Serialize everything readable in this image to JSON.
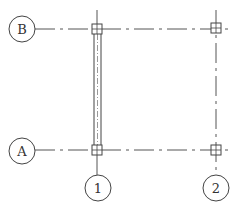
{
  "diagram": {
    "type": "structural-grid-plan",
    "colors": {
      "line": "#444444",
      "wall_inner": "#999999",
      "background": "#ffffff"
    },
    "grid_lines": {
      "horizontal": [
        {
          "label": "B",
          "y": 29,
          "bubble": {
            "cx": 22,
            "cy": 29,
            "r": 13
          },
          "x_start": 35,
          "x_end": 228
        },
        {
          "label": "A",
          "y": 150,
          "bubble": {
            "cx": 22,
            "cy": 151,
            "r": 13
          },
          "x_start": 35,
          "x_end": 228
        }
      ],
      "vertical": [
        {
          "label": "1",
          "x": 97,
          "bubble": {
            "cx": 98,
            "cy": 188,
            "r": 13
          },
          "y_start": 10,
          "y_end": 175
        },
        {
          "label": "2",
          "x": 216,
          "bubble": {
            "cx": 216,
            "cy": 188,
            "r": 13
          },
          "y_start": 10,
          "y_end": 175
        }
      ]
    },
    "columns": [
      {
        "grid": "B-1",
        "cx": 97,
        "cy": 29,
        "size": 10
      },
      {
        "grid": "B-2",
        "cx": 216,
        "cy": 28,
        "size": 10
      },
      {
        "grid": "A-1",
        "cx": 97,
        "cy": 150,
        "size": 10
      },
      {
        "grid": "A-2",
        "cx": 216,
        "cy": 150,
        "size": 10
      }
    ],
    "walls": [
      {
        "along": "grid 1",
        "from": "B",
        "to": "A",
        "x_left": 94,
        "x_right": 101,
        "y_start": 34,
        "y_end": 145
      }
    ]
  }
}
